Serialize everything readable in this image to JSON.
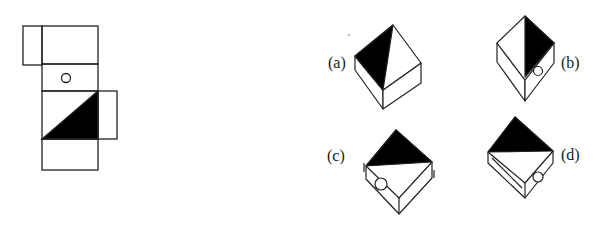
{
  "figure": {
    "type": "cube-net-folding-puzzle",
    "net": {
      "faces": [
        {
          "id": "top-left-flap",
          "content": "blank"
        },
        {
          "id": "top",
          "content": "blank"
        },
        {
          "id": "middle",
          "content": "circle"
        },
        {
          "id": "center",
          "content": "black-triangle"
        },
        {
          "id": "right-flap",
          "content": "blank"
        },
        {
          "id": "bottom",
          "content": "blank"
        }
      ]
    },
    "options": [
      {
        "label": "(a)"
      },
      {
        "label": "(b)"
      },
      {
        "label": "(c)"
      },
      {
        "label": "(d)"
      }
    ],
    "colors": {
      "stroke": "#222222",
      "fill": "#000000",
      "background": "#ffffff"
    }
  }
}
